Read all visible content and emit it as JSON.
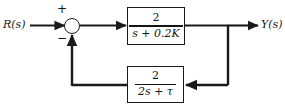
{
  "diagram": {
    "input_label": "R(s)",
    "output_label": "Y(s)",
    "summing_junction": {
      "name": "summing-junction",
      "plus_sign": "+",
      "minus_sign": "−"
    },
    "forward_block": {
      "name": "forward-path-transfer-function",
      "numerator": "2",
      "denominator_terms": {
        "variable": "s",
        "operator": "+",
        "coefficient": "0.2",
        "parameter": "K"
      },
      "denominator": "s + 0.2K",
      "expression": "2/(s + 0.2K)"
    },
    "feedback_block": {
      "name": "feedback-path-transfer-function",
      "numerator": "2",
      "denominator_terms": {
        "coefficient": "2",
        "variable": "s",
        "operator": "+",
        "parameter": "τ"
      },
      "denominator": "2s + τ",
      "expression": "2/(2s + τ)"
    },
    "colors": {
      "line": "#1a1a1a",
      "text": "#161616",
      "background": "#ffffff"
    }
  }
}
